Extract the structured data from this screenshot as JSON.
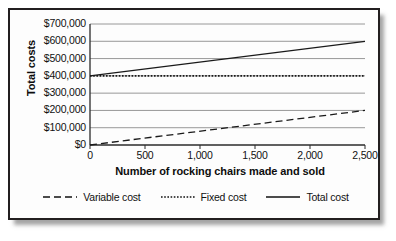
{
  "chart_data": {
    "type": "line",
    "title": "",
    "xlabel": "Number of rocking chairs made and sold",
    "ylabel": "Total costs",
    "xlim": [
      0,
      2500
    ],
    "ylim": [
      0,
      700000
    ],
    "grid": true,
    "legend_position": "bottom",
    "x_ticks": [
      {
        "value": 0,
        "label": "0"
      },
      {
        "value": 500,
        "label": "500"
      },
      {
        "value": 1000,
        "label": "1,000"
      },
      {
        "value": 1500,
        "label": "1,500"
      },
      {
        "value": 2000,
        "label": "2,000"
      },
      {
        "value": 2500,
        "label": "2,500"
      }
    ],
    "y_ticks": [
      {
        "value": 0,
        "label": "$0"
      },
      {
        "value": 100000,
        "label": "$100,000"
      },
      {
        "value": 200000,
        "label": "$200,000"
      },
      {
        "value": 300000,
        "label": "$300,000"
      },
      {
        "value": 400000,
        "label": "$400,000"
      },
      {
        "value": 500000,
        "label": "$500,000"
      },
      {
        "value": 600000,
        "label": "$600,000"
      },
      {
        "value": 700000,
        "label": "$700,000"
      }
    ],
    "x": [
      0,
      2500
    ],
    "series": [
      {
        "name": "Variable cost",
        "style": "dashed",
        "color": "#1a1a1a",
        "values": [
          0,
          200000
        ]
      },
      {
        "name": "Fixed cost",
        "style": "dotted",
        "color": "#1a1a1a",
        "values": [
          400000,
          400000
        ]
      },
      {
        "name": "Total cost",
        "style": "solid",
        "color": "#1a1a1a",
        "values": [
          400000,
          600000
        ]
      }
    ]
  },
  "legend": {
    "items": [
      {
        "label": "Variable cost",
        "style": "dashed"
      },
      {
        "label": "Fixed cost",
        "style": "dotted"
      },
      {
        "label": "Total cost",
        "style": "solid"
      }
    ]
  },
  "colors": {
    "frame_border": "#231f20",
    "plot_background": "#fdfdfd",
    "gridline": "#8c8c8c",
    "axis": "#2b2b2b",
    "ink": "#111111"
  }
}
